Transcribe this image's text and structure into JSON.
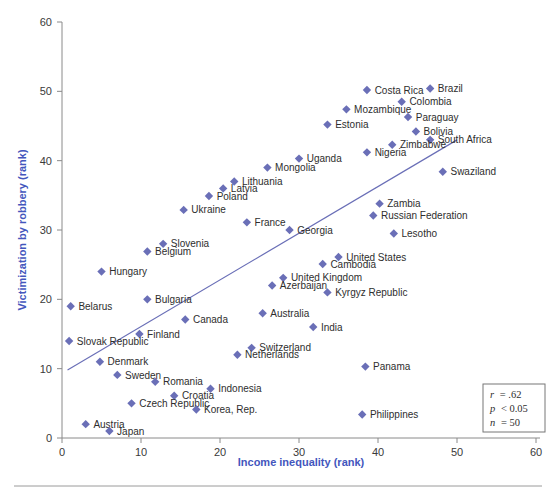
{
  "chart_data": {
    "type": "scatter",
    "title": "",
    "subtitle": "",
    "xlabel": "Income inequality (rank)",
    "ylabel": "Victimization by robbery (rank)",
    "xlim": [
      0,
      60
    ],
    "ylim": [
      0,
      60
    ],
    "xticks": [
      0,
      10,
      20,
      30,
      40,
      50,
      60
    ],
    "yticks": [
      0,
      10,
      20,
      30,
      40,
      50,
      60
    ],
    "grid": false,
    "legend": null,
    "marker": "diamond",
    "marker_color": "#6a6fb7",
    "trendline": {
      "visible": true,
      "color": "#6a6fb7",
      "x0": 0.7,
      "y0": 9.8,
      "x1": 50.0,
      "y1": 43.0
    },
    "annotations": {
      "stats_box": {
        "r_label": "r",
        "r_value": "= .62",
        "p_label": "p",
        "p_value": "< 0.05",
        "n_label": "n",
        "n_value": "= 50"
      }
    },
    "points": [
      {
        "label": "Costa Rica",
        "x": 38.6,
        "y": 50.2,
        "lp": "right"
      },
      {
        "label": "Brazil",
        "x": 46.6,
        "y": 50.4,
        "lp": "right"
      },
      {
        "label": "Colombia",
        "x": 43.0,
        "y": 48.5,
        "lp": "right"
      },
      {
        "label": "Mozambique",
        "x": 36.0,
        "y": 47.4,
        "lp": "right"
      },
      {
        "label": "Paraguay",
        "x": 43.8,
        "y": 46.3,
        "lp": "right"
      },
      {
        "label": "Estimate-hidden",
        "x": -99,
        "y": -99,
        "lp": "right"
      },
      {
        "label": "Estonia",
        "x": 33.6,
        "y": 45.2,
        "lp": "right"
      },
      {
        "label": "Bolivia",
        "x": 44.8,
        "y": 44.2,
        "lp": "right"
      },
      {
        "label": "South Africa",
        "x": 46.6,
        "y": 43.0,
        "lp": "right"
      },
      {
        "label": "Zimbabwe",
        "x": 41.8,
        "y": 42.3,
        "lp": "right"
      },
      {
        "label": "Uganda",
        "x": 30.0,
        "y": 40.3,
        "lp": "right"
      },
      {
        "label": "Nigeria",
        "x": 38.6,
        "y": 41.2,
        "lp": "right"
      },
      {
        "label": "Mongolia",
        "x": 26.0,
        "y": 39.0,
        "lp": "right"
      },
      {
        "label": "Swaziland",
        "x": 48.2,
        "y": 38.4,
        "lp": "right"
      },
      {
        "label": "Lithuania",
        "x": 21.8,
        "y": 37.0,
        "lp": "right"
      },
      {
        "label": "Latvia",
        "x": 20.4,
        "y": 36.0,
        "lp": "right"
      },
      {
        "label": "Poland",
        "x": 18.6,
        "y": 34.9,
        "lp": "right"
      },
      {
        "label": "Zambia",
        "x": 40.2,
        "y": 33.8,
        "lp": "right"
      },
      {
        "label": "Ukraine",
        "x": 15.4,
        "y": 32.9,
        "lp": "right"
      },
      {
        "label": "Russian Federation",
        "x": 39.4,
        "y": 32.1,
        "lp": "right"
      },
      {
        "label": "France",
        "x": 23.4,
        "y": 31.1,
        "lp": "right"
      },
      {
        "label": "Georgia",
        "x": 28.8,
        "y": 30.0,
        "lp": "right"
      },
      {
        "label": "Lesotho",
        "x": 42.0,
        "y": 29.5,
        "lp": "right"
      },
      {
        "label": "Slovenia",
        "x": 12.8,
        "y": 28.0,
        "lp": "right"
      },
      {
        "label": "Belgium",
        "x": 10.8,
        "y": 26.9,
        "lp": "right"
      },
      {
        "label": "United States",
        "x": 35.0,
        "y": 26.1,
        "lp": "right"
      },
      {
        "label": "Cambodia",
        "x": 33.0,
        "y": 25.1,
        "lp": "right"
      },
      {
        "label": "Hungary",
        "x": 5.0,
        "y": 24.0,
        "lp": "right"
      },
      {
        "label": "United Kingdom",
        "x": 28.0,
        "y": 23.1,
        "lp": "right"
      },
      {
        "label": "Azerbaijan",
        "x": 26.6,
        "y": 22.0,
        "lp": "right"
      },
      {
        "label": "Kyrgyz Republic",
        "x": 33.6,
        "y": 21.0,
        "lp": "right"
      },
      {
        "label": "Bulgaria",
        "x": 10.8,
        "y": 20.0,
        "lp": "right"
      },
      {
        "label": "Belarus",
        "x": 1.1,
        "y": 19.0,
        "lp": "right"
      },
      {
        "label": "Australia",
        "x": 25.4,
        "y": 18.0,
        "lp": "right"
      },
      {
        "label": "Canada",
        "x": 15.6,
        "y": 17.1,
        "lp": "right"
      },
      {
        "label": "India",
        "x": 31.8,
        "y": 16.0,
        "lp": "right"
      },
      {
        "label": "Finland",
        "x": 9.8,
        "y": 15.0,
        "lp": "right"
      },
      {
        "label": "Slovak Republic",
        "x": 0.9,
        "y": 14.0,
        "lp": "right"
      },
      {
        "label": "Switzerland",
        "x": 24.0,
        "y": 13.0,
        "lp": "right"
      },
      {
        "label": "Netherlands",
        "x": 22.2,
        "y": 12.0,
        "lp": "right"
      },
      {
        "label": "Denmark",
        "x": 4.8,
        "y": 11.0,
        "lp": "right"
      },
      {
        "label": "Panama",
        "x": 38.4,
        "y": 10.3,
        "lp": "right"
      },
      {
        "label": "Sweden",
        "x": 7.0,
        "y": 9.1,
        "lp": "right"
      },
      {
        "label": "Romania",
        "x": 11.8,
        "y": 8.1,
        "lp": "right"
      },
      {
        "label": "Indonesia",
        "x": 18.8,
        "y": 7.1,
        "lp": "right"
      },
      {
        "label": "Croatia",
        "x": 14.2,
        "y": 6.1,
        "lp": "right"
      },
      {
        "label": "Czech Republic",
        "x": 8.8,
        "y": 5.0,
        "lp": "right"
      },
      {
        "label": "Korea, Rep.",
        "x": 17.0,
        "y": 4.1,
        "lp": "right"
      },
      {
        "label": "Philippines",
        "x": 38.0,
        "y": 3.4,
        "lp": "right"
      },
      {
        "label": "Austria",
        "x": 3.0,
        "y": 2.0,
        "lp": "right"
      },
      {
        "label": "Japan",
        "x": 6.0,
        "y": 1.0,
        "lp": "right"
      }
    ]
  }
}
